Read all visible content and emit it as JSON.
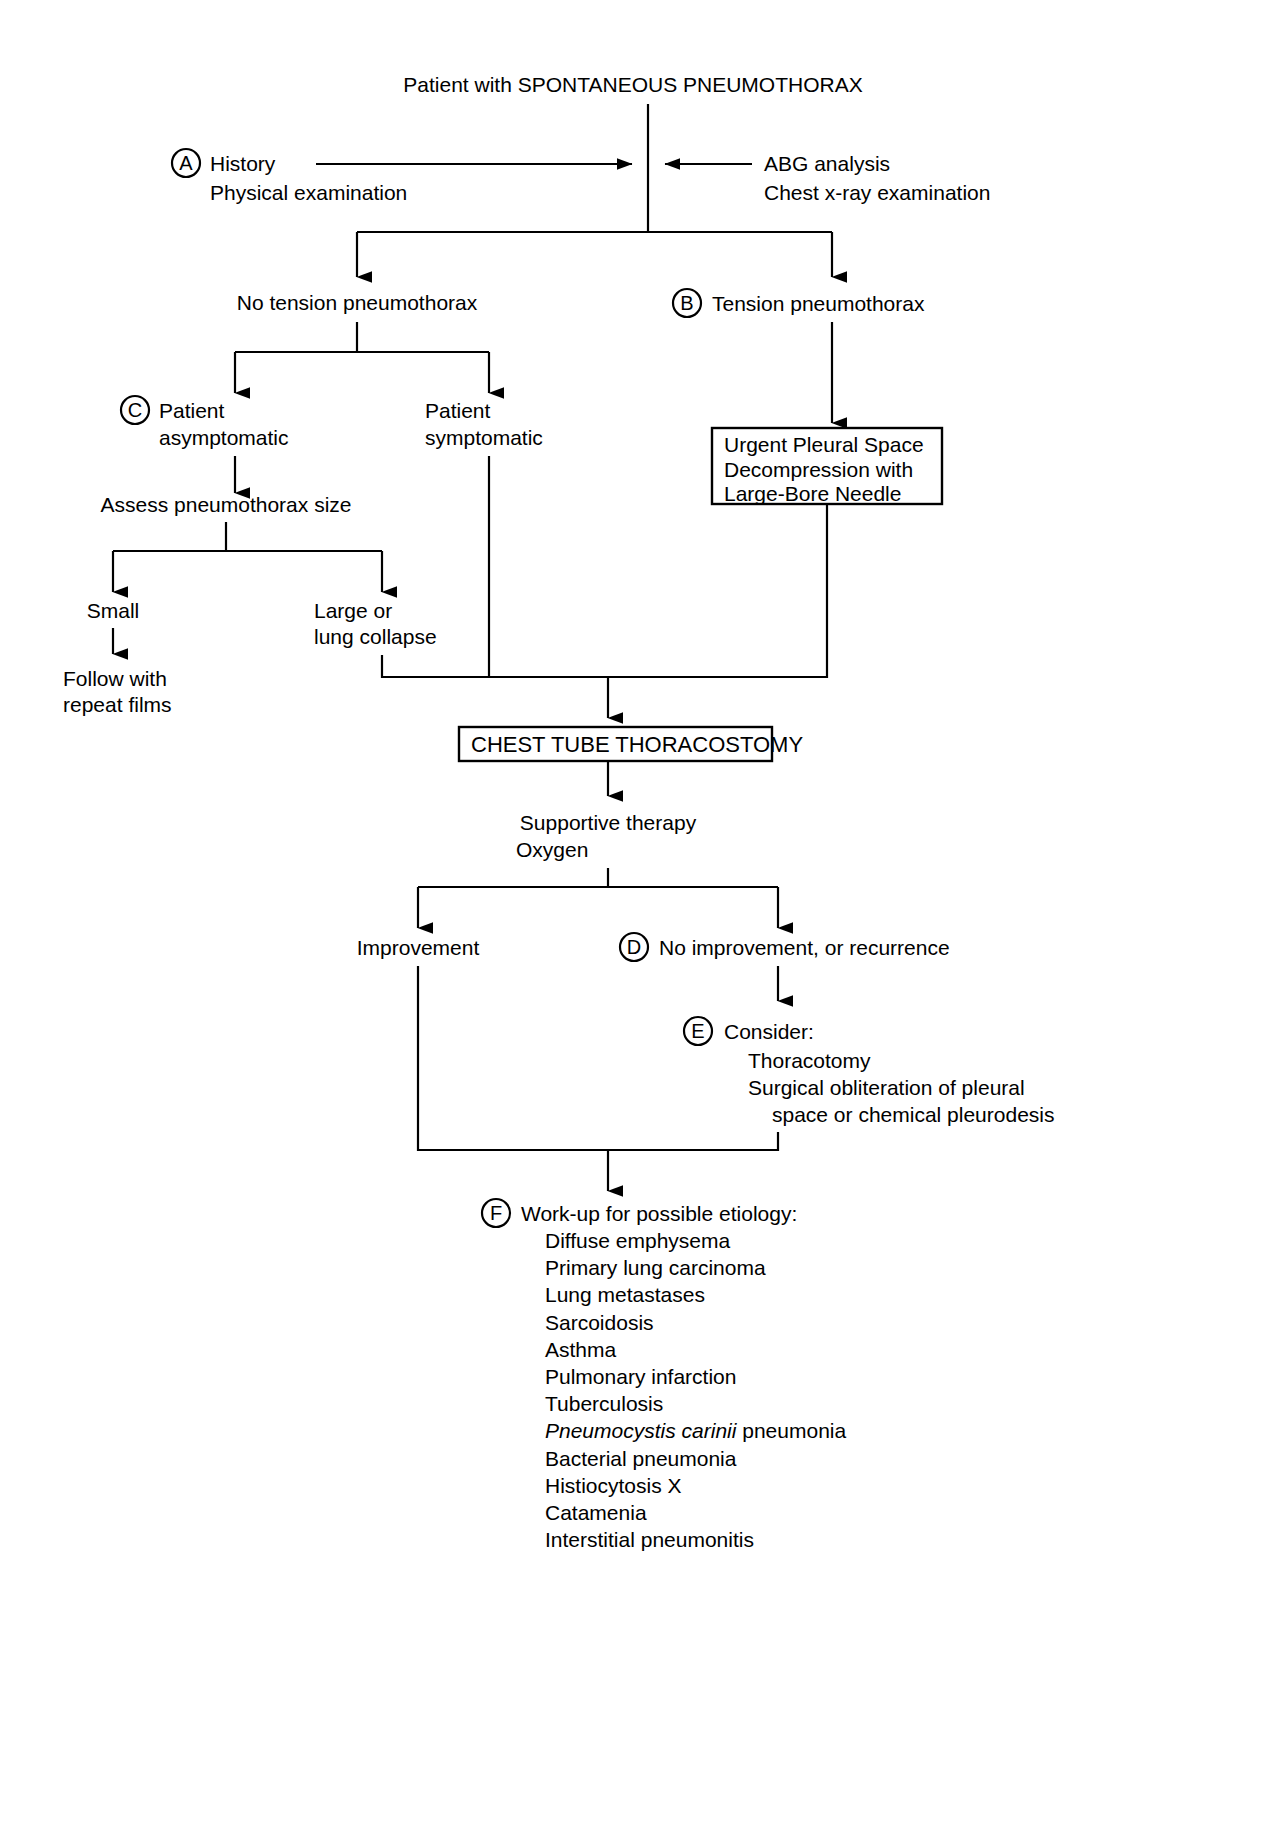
{
  "diagram": {
    "type": "clinical-decision-algorithm",
    "title": "Patient with SPONTANEOUS PNEUMOTHORAX",
    "nodes": {
      "root": "Patient with SPONTANEOUS PNEUMOTHORAX",
      "a_label": "A",
      "a_line1": "History",
      "a_line2": "Physical examination",
      "right_line1": "ABG analysis",
      "right_line2": "Chest x-ray examination",
      "no_tension": "No tension pneumothorax",
      "b_label": "B",
      "b_text": "Tension pneumothorax",
      "c_label": "C",
      "c_line1": "Patient",
      "c_line2": "asymptomatic",
      "symptomatic_line1": "Patient",
      "symptomatic_line2": "symptomatic",
      "urgent_box_line1": "Urgent Pleural Space",
      "urgent_box_line2": "Decompression with",
      "urgent_box_line3": "Large-Bore Needle",
      "assess": "Assess pneumothorax size",
      "small": "Small",
      "large_line1": "Large or",
      "large_line2": "lung collapse",
      "follow_line1": "Follow with",
      "follow_line2": "repeat films",
      "chest_tube_box": "CHEST TUBE THORACOSTOMY",
      "supportive_line1": "Supportive therapy",
      "supportive_line2": "Oxygen",
      "improvement": "Improvement",
      "d_label": "D",
      "d_text": "No improvement, or recurrence",
      "e_label": "E",
      "e_line1": "Consider:",
      "e_line2": "Thoracotomy",
      "e_line3": "Surgical obliteration of pleural",
      "e_line4": "space or chemical pleurodesis",
      "f_label": "F",
      "f_heading": "Work-up for possible etiology:"
    },
    "etiology_list": [
      {
        "text": "Diffuse emphysema",
        "italic": ""
      },
      {
        "text": "Primary lung carcinoma",
        "italic": ""
      },
      {
        "text": "Lung metastases",
        "italic": ""
      },
      {
        "text": "Sarcoidosis",
        "italic": ""
      },
      {
        "text": "Asthma",
        "italic": ""
      },
      {
        "text": "Pulmonary infarction",
        "italic": ""
      },
      {
        "text": "Tuberculosis",
        "italic": ""
      },
      {
        "text": " pneumonia",
        "italic": "Pneumocystis carinii"
      },
      {
        "text": "Bacterial pneumonia",
        "italic": ""
      },
      {
        "text": "Histiocytosis X",
        "italic": ""
      },
      {
        "text": "Catamenia",
        "italic": ""
      },
      {
        "text": "Interstitial pneumonitis",
        "italic": ""
      }
    ],
    "colors": {
      "ink": "#000000",
      "paper": "#ffffff"
    }
  }
}
